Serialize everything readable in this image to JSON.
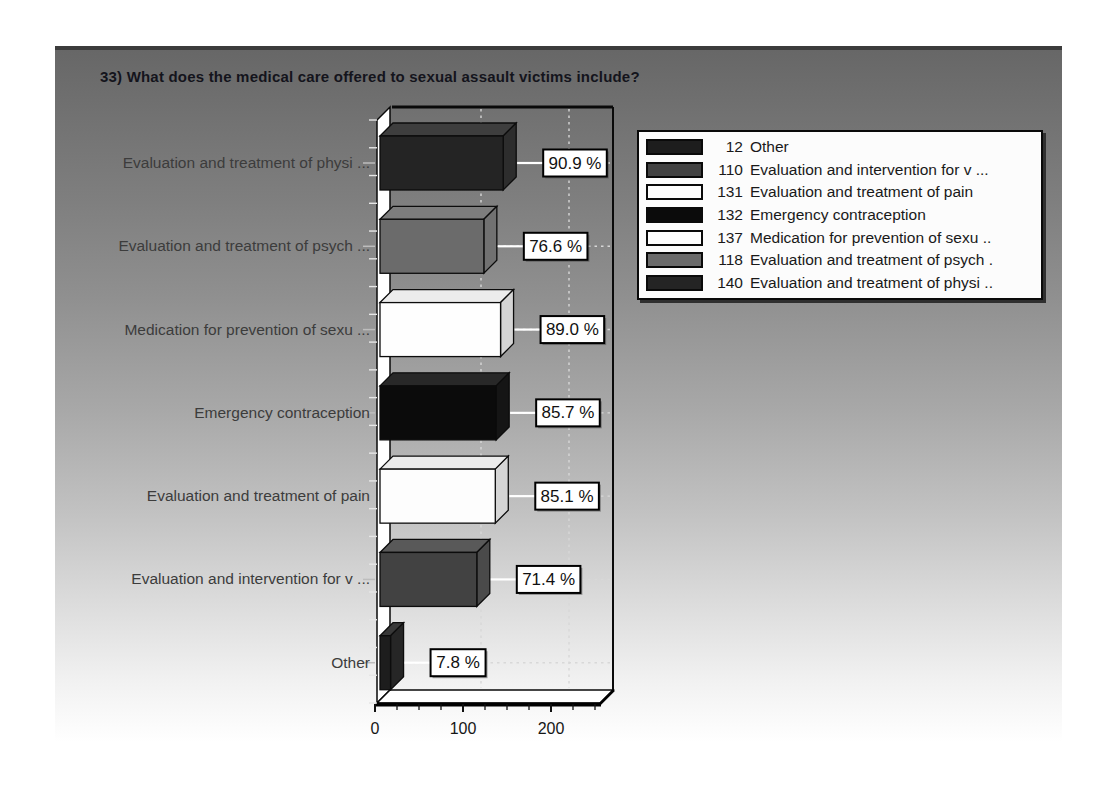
{
  "title": "33) What does the medical care offered to sexual assault victims include?",
  "panel": {
    "gradient_top": "#676767",
    "gradient_bottom": "#ffffff",
    "top_border_color": "#3c3c3c"
  },
  "chart_data": {
    "type": "bar",
    "orientation": "horizontal",
    "style": "3d",
    "title": "33) What does the medical care offered to sexual assault victims include?",
    "xlabel": "",
    "ylabel": "",
    "xlim": [
      0,
      250
    ],
    "x_ticks": [
      0,
      100,
      200
    ],
    "x_minor_step": 25,
    "grid": "dashed-white",
    "bars": [
      {
        "label": "Evaluation and treatment of physi ...",
        "count": 140,
        "percent": "90.9 %",
        "color": "#242424"
      },
      {
        "label": "Evaluation and treatment of psych ...",
        "count": 118,
        "percent": "76.6 %",
        "color": "#6b6b6b"
      },
      {
        "label": "Medication for prevention of sexu ...",
        "count": 137,
        "percent": "89.0 %",
        "color": "#fefefe"
      },
      {
        "label": "Emergency contraception",
        "count": 132,
        "percent": "85.7 %",
        "color": "#0b0b0b"
      },
      {
        "label": "Evaluation and treatment of pain",
        "count": 131,
        "percent": "85.1 %",
        "color": "#fdfdfd"
      },
      {
        "label": "Evaluation and intervention for v ...",
        "count": 110,
        "percent": "71.4 %",
        "color": "#424242"
      },
      {
        "label": "Other",
        "count": 12,
        "percent": "7.8 %",
        "color": "#1d1d1d"
      }
    ],
    "legend_position": "top-right",
    "legend": [
      {
        "count": 12,
        "label": "Other",
        "color": "#1d1d1d"
      },
      {
        "count": 110,
        "label": "Evaluation and intervention for v ...",
        "color": "#424242"
      },
      {
        "count": 131,
        "label": "Evaluation and treatment of pain",
        "color": "#fdfdfd"
      },
      {
        "count": 132,
        "label": "Emergency contraception",
        "color": "#0b0b0b"
      },
      {
        "count": 137,
        "label": "Medication for prevention of sexu ..",
        "color": "#fefefe"
      },
      {
        "count": 118,
        "label": "Evaluation and treatment of psych .",
        "color": "#6b6b6b"
      },
      {
        "count": 140,
        "label": "Evaluation and treatment of physi ..",
        "color": "#242424"
      }
    ]
  }
}
